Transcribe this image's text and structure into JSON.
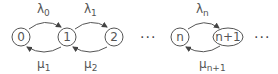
{
  "diagram": {
    "type": "birth-death chain",
    "nodes": [
      {
        "id": "0",
        "label": "0"
      },
      {
        "id": "1",
        "label": "1"
      },
      {
        "id": "2",
        "label": "2"
      },
      {
        "id": "n",
        "label": "n"
      },
      {
        "id": "n+1",
        "label": "n+1"
      }
    ],
    "forward_rates": [
      {
        "sym": "λ",
        "sub": "0",
        "from": "0",
        "to": "1"
      },
      {
        "sym": "λ",
        "sub": "1",
        "from": "1",
        "to": "2"
      },
      {
        "sym": "λ",
        "sub": "n",
        "from": "n",
        "to": "n+1"
      }
    ],
    "backward_rates": [
      {
        "sym": "μ",
        "sub": "1",
        "from": "1",
        "to": "0"
      },
      {
        "sym": "μ",
        "sub": "2",
        "from": "2",
        "to": "1"
      },
      {
        "sym": "μ",
        "sub": "n+1",
        "from": "n+1",
        "to": "n"
      }
    ],
    "ellipsis": "···"
  }
}
